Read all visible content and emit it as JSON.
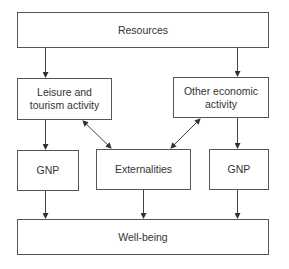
{
  "diagram": {
    "nodes": {
      "resources": "Resources",
      "leisure": "Leisure and tourism activity",
      "other": "Other economic activity",
      "gnp_left": "GNP",
      "externalities": "Externalities",
      "gnp_right": "GNP",
      "wellbeing": "Well-being"
    },
    "edges": [
      {
        "from": "resources",
        "to": "leisure",
        "type": "arrow"
      },
      {
        "from": "resources",
        "to": "other",
        "type": "arrow"
      },
      {
        "from": "leisure",
        "to": "gnp_left",
        "type": "arrow"
      },
      {
        "from": "other",
        "to": "gnp_right",
        "type": "arrow"
      },
      {
        "from": "leisure",
        "to": "externalities",
        "type": "bidirectional"
      },
      {
        "from": "other",
        "to": "externalities",
        "type": "bidirectional"
      },
      {
        "from": "gnp_left",
        "to": "wellbeing",
        "type": "arrow"
      },
      {
        "from": "externalities",
        "to": "wellbeing",
        "type": "arrow"
      },
      {
        "from": "gnp_right",
        "to": "wellbeing",
        "type": "arrow"
      }
    ],
    "colors": {
      "line": "#444444",
      "text": "#333333",
      "background": "#ffffff"
    }
  }
}
